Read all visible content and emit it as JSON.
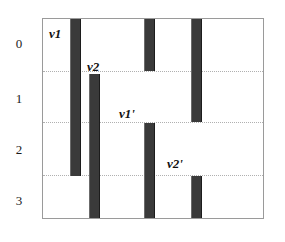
{
  "figure": {
    "title": "",
    "background_color": "#ffffff",
    "frame_color": "#9a9a9a",
    "bar_color": "#3a3a3a",
    "gridline_color": "#b0b0b0"
  },
  "axis": {
    "row_labels": [
      {
        "text": "0",
        "x": 12,
        "y": 37
      },
      {
        "text": "1",
        "x": 12,
        "y": 92
      },
      {
        "text": "2",
        "x": 12,
        "y": 143
      },
      {
        "text": "3",
        "x": 12,
        "y": 194
      }
    ]
  },
  "gridlines": [
    {
      "name": "gridline-0-1",
      "y": 52
    },
    {
      "name": "gridline-1-2",
      "y": 103
    },
    {
      "name": "gridline-2-3",
      "y": 156
    }
  ],
  "bars": [
    {
      "name": "bar-v1",
      "x": 27,
      "y": 0,
      "width": 11,
      "height": 157
    },
    {
      "name": "bar-v2",
      "x": 46,
      "y": 55,
      "width": 11,
      "height": 146
    },
    {
      "name": "bar-top-mid",
      "x": 101,
      "y": 0,
      "width": 11,
      "height": 52
    },
    {
      "name": "bar-v1-prime",
      "x": 101,
      "y": 104,
      "width": 11,
      "height": 97
    },
    {
      "name": "bar-top-right",
      "x": 148,
      "y": 0,
      "width": 11,
      "height": 103
    },
    {
      "name": "bar-v2-prime",
      "x": 148,
      "y": 157,
      "width": 11,
      "height": 44
    }
  ],
  "labels": [
    {
      "name": "label-v1",
      "text": "v1",
      "x": 6,
      "y": 8
    },
    {
      "name": "label-v2",
      "text": "v2",
      "x": 44,
      "y": 41
    },
    {
      "name": "label-v1-prime",
      "text": "v1'",
      "x": 76,
      "y": 88
    },
    {
      "name": "label-v2-prime",
      "text": "v2'",
      "x": 124,
      "y": 138
    }
  ]
}
